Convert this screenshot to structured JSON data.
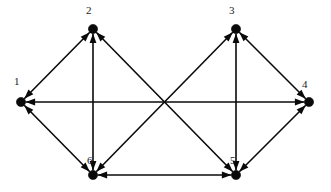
{
  "diagram": {
    "type": "directed-graph",
    "canvas": {
      "width": 331,
      "height": 192,
      "background": "#ffffff"
    },
    "style": {
      "line_color": "#0a0a0a",
      "node_color": "#0a0a0a",
      "label_color": "#1a1a1a",
      "line_width": 1.6,
      "node_radius": 4.6,
      "arrow_length": 9.5,
      "arrow_half_width": 3.4,
      "label_font_size": 11
    },
    "nodes": [
      {
        "id": "1",
        "label": "1",
        "x": 21,
        "y": 102,
        "label_x": 14,
        "label_y": 76
      },
      {
        "id": "2",
        "label": "2",
        "x": 93,
        "y": 29,
        "label_x": 86,
        "label_y": 5
      },
      {
        "id": "3",
        "label": "3",
        "x": 236,
        "y": 29,
        "label_x": 229,
        "label_y": 5
      },
      {
        "id": "4",
        "label": "4",
        "x": 309,
        "y": 102,
        "label_x": 302,
        "label_y": 79
      },
      {
        "id": "5",
        "label": "5",
        "x": 236,
        "y": 175,
        "label_x": 230,
        "label_y": 155
      },
      {
        "id": "6",
        "label": "6",
        "x": 93,
        "y": 175,
        "label_x": 87,
        "label_y": 155
      }
    ],
    "edges": [
      {
        "from": "1",
        "to": "2",
        "bidirectional": true,
        "name": "edge-1-2"
      },
      {
        "from": "1",
        "to": "4",
        "bidirectional": true,
        "name": "edge-1-4"
      },
      {
        "from": "1",
        "to": "6",
        "bidirectional": true,
        "name": "edge-1-6"
      },
      {
        "from": "2",
        "to": "6",
        "bidirectional": true,
        "name": "edge-2-6"
      },
      {
        "from": "2",
        "to": "5",
        "bidirectional": true,
        "name": "edge-2-5"
      },
      {
        "from": "3",
        "to": "6",
        "bidirectional": true,
        "name": "edge-3-6"
      },
      {
        "from": "3",
        "to": "5",
        "bidirectional": true,
        "name": "edge-3-5"
      },
      {
        "from": "3",
        "to": "4",
        "bidirectional": true,
        "name": "edge-3-4"
      },
      {
        "from": "4",
        "to": "5",
        "bidirectional": true,
        "name": "edge-4-5"
      },
      {
        "from": "5",
        "to": "6",
        "bidirectional": true,
        "name": "edge-5-6"
      }
    ]
  }
}
